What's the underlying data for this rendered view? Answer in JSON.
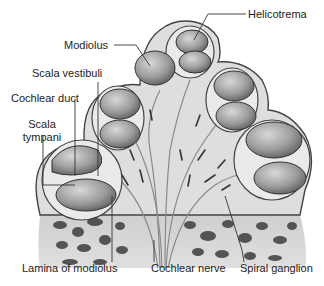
{
  "figure": {
    "labels": {
      "helicotrema": "Helicotrema",
      "modiolus": "Modiolus",
      "scala_vestibuli": "Scala vestibuli",
      "cochlear_duct": "Cochlear duct",
      "scala_tympani_line1": "Scala",
      "scala_tympani_line2": "tympani",
      "lamina_of_modiolus": "Lamina of modiolus",
      "cochlear_nerve": "Cochlear nerve",
      "spiral_ganglion": "Spiral ganglion"
    },
    "colors": {
      "background": "#ffffff",
      "tissue": "#dcdcdc",
      "tissue_edge": "#555555",
      "chamber": "#9a9a9a",
      "chamber_light": "#c8c8c8",
      "bone_hole": "#3a3a3a",
      "leader_line": "#333333"
    }
  }
}
